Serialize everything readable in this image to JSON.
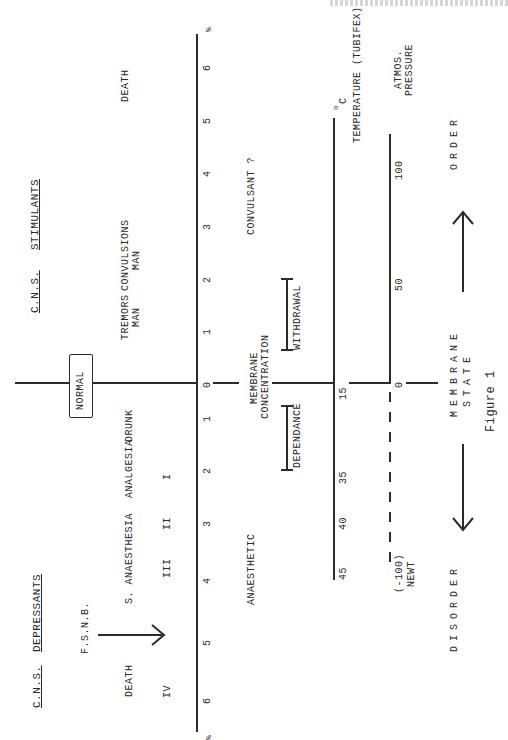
{
  "page_header": "",
  "figure": {
    "caption": "Figure 1",
    "left_heading_prefix": "C.N.S.",
    "left_heading": "STIMULANTS",
    "right_heading_prefix": "C.N.S.",
    "right_heading": "DEPRESSANTS",
    "normal_box": "NORMAL",
    "main_axis": {
      "unit": "%",
      "ticks_stimulant_side": [
        "0",
        "1",
        "2",
        "3",
        "4",
        "5",
        "6"
      ],
      "ticks_depressant_side": [
        "1",
        "2",
        "3",
        "4",
        "5",
        "6"
      ],
      "unit_bottom": "%"
    },
    "stimulant_labels": {
      "death": "DEATH",
      "tremors": "TREMORS",
      "tremors_sub": "MAN",
      "convulsions": "CONVULSIONS",
      "convulsions_sub": "MAN",
      "convulsant": "CONVULSANT ?"
    },
    "depressant_labels": {
      "drunk": "DRUNK",
      "analgesia": "ANALGESIA",
      "s_anaesthesia": "S. ANAESTHESIA",
      "fsnb": "F.S.N.B.",
      "death": "DEATH",
      "stage_1": "I",
      "stage_2": "II",
      "stage_3": "III",
      "stage_4": "IV",
      "anaesthetic": "ANAESTHETIC"
    },
    "membrane_concentration": "MEMBRANE",
    "membrane_concentration_2": "CONCENTRATION",
    "withdrawal": "WITHDRAWAL",
    "dependance": "DEPENDANCE",
    "temperature_axis": {
      "label": "TEMPERATURE (TUBIFEX)",
      "unit": "oC",
      "unit_o": "o",
      "unit_c": "C",
      "ticks": [
        "15",
        "35",
        "40",
        "45"
      ]
    },
    "pressure_axis": {
      "label_1": "ATMOS.",
      "label_2": "PRESSURE",
      "ticks": [
        "0",
        "50",
        "100"
      ],
      "negative_tick": "(-100)",
      "negative_label": "NEWT"
    },
    "membrane_state": {
      "line1": "MEMBRANE",
      "line2": "STATE",
      "order": "ORDER",
      "disorder": "DISORDER"
    }
  }
}
